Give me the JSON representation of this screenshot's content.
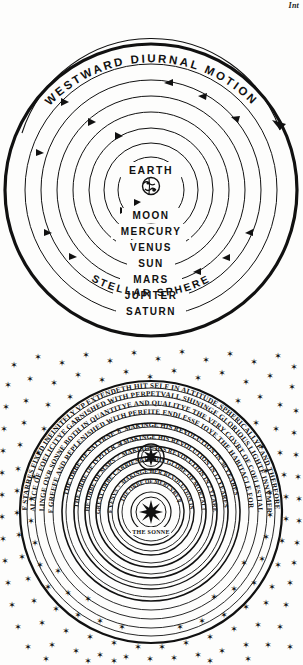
{
  "page": {
    "corner_note": "Int",
    "background_color": "#fdfdfc",
    "ink_color": "#111111"
  },
  "figures": [
    {
      "id": "ptolemaic-diagram",
      "name": "ptolemaic-geocentric-diagram",
      "caption_arc": "WESTWARD DIURNAL MOTION",
      "center_label": "EARTH",
      "center_icon": "globe-icon",
      "outer_label": "STELLAR SPHERE",
      "spheres": [
        {
          "label": "MOON",
          "radius": 33
        },
        {
          "label": "MERCURY",
          "radius": 47
        },
        {
          "label": "VENUS",
          "radius": 62
        },
        {
          "label": "SUN",
          "radius": 78
        },
        {
          "label": "MARS",
          "radius": 94
        },
        {
          "label": "JUPITER",
          "radius": 110
        },
        {
          "label": "SATURN",
          "radius": 126
        },
        {
          "label": "STELLAR SPHERE",
          "radius": 146
        }
      ],
      "motion_direction": "counterclockwise",
      "arrow_count": 14
    },
    {
      "id": "digges-diagram",
      "name": "digges-copernican-diagram",
      "center_label": "THE SONNE",
      "center_icon": "sun-icon",
      "star_field": true,
      "star_count": 150,
      "rings": [
        {
          "name": "orb-of-starres-fixed",
          "text": "THIS ORBE OF STARRES FIXED INFINITELY VP EXTENDETH HIT SELF IN ALTITUDE SPHERICALLYE AND THERFORE IMMOVABLE"
        },
        {
          "name": "palace-of-foelicitye",
          "text": "THE PALACE OF FOELICITYE GARNISHED WITH PERPETVALL SHININGE GLORIOUS LIGHTE INNVMERABLE"
        },
        {
          "name": "quantitye-and-qualitye",
          "text": "FARR EXCELLINGE OVR SONNE BOTH IN QUANTITYE AND QUALITYE THE VERY COVRT OF COELESTIALL ANGELLES"
        },
        {
          "name": "devoyd-of-greefe",
          "text": "DEVOYD OF GREEFE AND REPLENISHED WITH PERFITE ENDLESSE IOYE THE HABITACLE FOR THE ELECT"
        },
        {
          "name": "orb-of-saturn",
          "text": "THE ORBE OF SATVRNE ♄ MAKINGE HIS REVOLUTION IN 30 YEARES",
          "symbol": "♄"
        },
        {
          "name": "orb-of-jupiter",
          "text": "THE ORBE OF IVPITER ♃ MAKINGE HIS REVOLUTION IN 12 YEARES",
          "symbol": "♃"
        },
        {
          "name": "orb-of-mars",
          "text": "THE ORBE OF MARS ♂ MAKINGE HIS REVOLUTION IN 2 YEARES",
          "symbol": "♂"
        },
        {
          "name": "orb-of-earth-annuall",
          "text": "THE GREAT ORBE CARRIENGE THIS GLOBE OF MORTALITYE ♁",
          "symbol": "♁"
        },
        {
          "name": "orb-of-venus",
          "text": "THE ORBE OF VENVS ♀ MAKINGE HER REVOLUTION IN 9 MONETHES",
          "symbol": "♀"
        },
        {
          "name": "orb-of-mercury",
          "text": "THE ORBE OF MERCVRY ☿",
          "symbol": "☿"
        }
      ]
    }
  ]
}
